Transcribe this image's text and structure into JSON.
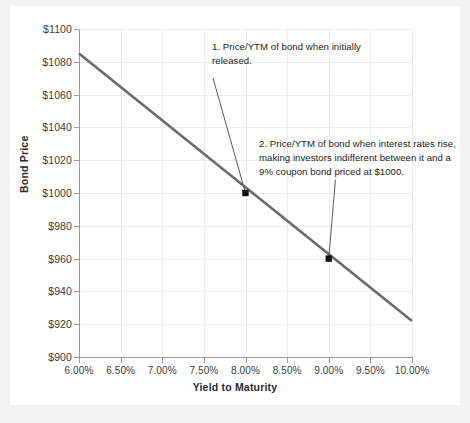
{
  "chart_data": {
    "type": "line",
    "title": "",
    "xlabel": "Yield to Maturity",
    "ylabel": "Bond Price",
    "xlim": [
      6.0,
      10.0
    ],
    "ylim": [
      900,
      1100
    ],
    "grid": true,
    "legend": "none",
    "x_ticks": [
      {
        "value": 6.0,
        "label": "6.00%"
      },
      {
        "value": 6.5,
        "label": "6.50%"
      },
      {
        "value": 7.0,
        "label": "7.00%"
      },
      {
        "value": 7.5,
        "label": "7.50%"
      },
      {
        "value": 8.0,
        "label": "8.00%"
      },
      {
        "value": 8.5,
        "label": "8.50%"
      },
      {
        "value": 9.0,
        "label": "9.00%"
      },
      {
        "value": 9.5,
        "label": "9.50%"
      },
      {
        "value": 10.0,
        "label": "10.00%"
      }
    ],
    "y_ticks": [
      {
        "value": 900,
        "label": "$900"
      },
      {
        "value": 920,
        "label": "$920"
      },
      {
        "value": 940,
        "label": "$940"
      },
      {
        "value": 960,
        "label": "$960"
      },
      {
        "value": 980,
        "label": "$980"
      },
      {
        "value": 1000,
        "label": "$1000"
      },
      {
        "value": 1020,
        "label": "$1020"
      },
      {
        "value": 1040,
        "label": "$1040"
      },
      {
        "value": 1060,
        "label": "$1060"
      },
      {
        "value": 1080,
        "label": "$1080"
      },
      {
        "value": 1100,
        "label": "$1100"
      }
    ],
    "series": [
      {
        "name": "Bond price curve",
        "color": "#6a6a6a",
        "x": [
          6.0,
          10.0
        ],
        "values": [
          1085,
          922
        ]
      }
    ],
    "markers": [
      {
        "name": "point-initial-issue",
        "x": 8.0,
        "y": 1000,
        "color": "#111111"
      },
      {
        "name": "point-rate-rise",
        "x": 9.0,
        "y": 960,
        "color": "#111111"
      }
    ],
    "annotations": [
      {
        "id": "annotation-1",
        "text": "1. Price/YTM of bond when initially released.",
        "leader_from": {
          "x": 7.61,
          "y": 1070
        },
        "leader_to": {
          "x": 8.0,
          "y": 1000
        }
      },
      {
        "id": "annotation-2",
        "text": "2. Price/YTM of bond when interest rates rise, making investors indifferent between it and a 9% coupon bond priced at $1000.",
        "leader_from": {
          "x": 9.08,
          "y": 1008
        },
        "leader_to": {
          "x": 9.0,
          "y": 960
        }
      }
    ]
  },
  "colors": {
    "page_background": "#f2f2f2",
    "card_background": "#ffffff",
    "gridline": "#ededed",
    "axis": "#9a9a9a",
    "line": "#6a6a6a",
    "marker": "#111111",
    "text": "#1c1c1c"
  }
}
